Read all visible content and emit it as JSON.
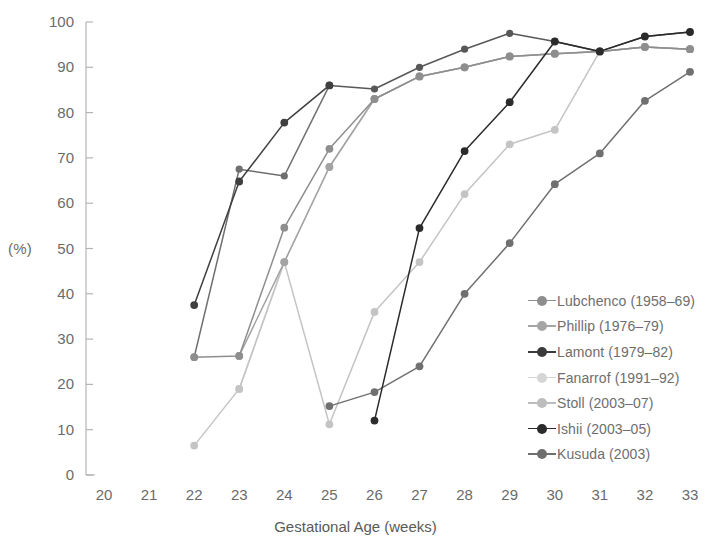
{
  "chart_data": {
    "type": "line",
    "title": "",
    "xlabel": "Gestational Age (weeks)",
    "ylabel": "(%)",
    "xlim": [
      20,
      33
    ],
    "ylim": [
      0,
      100
    ],
    "xticks": [
      20,
      21,
      22,
      23,
      24,
      25,
      26,
      27,
      28,
      29,
      30,
      31,
      32,
      33
    ],
    "yticks": [
      0,
      10,
      20,
      30,
      40,
      50,
      60,
      70,
      80,
      90,
      100
    ],
    "grid": false,
    "legend_position": "right-lower",
    "categories": [
      20,
      21,
      22,
      23,
      24,
      25,
      26,
      27,
      28,
      29,
      30,
      31,
      32,
      33
    ],
    "series": [
      {
        "name": "Lubchenco (1958–69)",
        "color": "#8e8e8e",
        "x": [
          22,
          23,
          24,
          25,
          26,
          27,
          28,
          29,
          30,
          31,
          32,
          33
        ],
        "values": [
          26.0,
          26.3,
          54.6,
          72.0,
          83.0,
          88.0,
          90.0,
          92.4,
          93.0,
          93.5,
          94.5,
          94.0
        ]
      },
      {
        "name": "Phillip (1976–79)",
        "color": "#a3a3a3",
        "x": [
          23,
          24,
          25,
          26,
          27,
          28,
          29,
          30,
          31,
          32,
          33
        ],
        "values": [
          26.3,
          47.0,
          68.0,
          83.0,
          88.0,
          90.0,
          92.4,
          93.0,
          93.5,
          94.5,
          94.0
        ]
      },
      {
        "name": "Lamont (1979–82)",
        "color": "#3f3f3f",
        "x": [
          22,
          23,
          24,
          25
        ],
        "values": [
          37.5,
          64.8,
          77.8,
          86.0
        ]
      },
      {
        "name": "Fanarrof (1991–92)",
        "color": "#d2d2d2",
        "x": [
          23,
          24,
          25,
          26,
          27,
          28,
          29,
          30,
          31,
          32,
          33
        ],
        "values": [
          19.0,
          47.0,
          68.0,
          83.0,
          88.0,
          90.0,
          92.4,
          93.0,
          93.5,
          94.5,
          94.0
        ]
      },
      {
        "name": "Stoll (2003–07)",
        "color": "#c4c4c4",
        "x": [
          22,
          23,
          24,
          25,
          26,
          27,
          28,
          29,
          30,
          31,
          32,
          33
        ],
        "values": [
          6.5,
          19.0,
          47.0,
          11.2,
          36.0,
          47.0,
          62.0,
          73.0,
          76.2,
          93.5,
          94.5,
          94.0
        ]
      },
      {
        "name": "Ishii (2003–05)",
        "color": "#2b2b2b",
        "x": [
          26,
          27,
          28,
          29,
          30,
          31,
          32,
          33
        ],
        "values": [
          12.0,
          54.5,
          71.5,
          82.3,
          95.7,
          93.5,
          96.8,
          97.8
        ]
      },
      {
        "name": "Kusuda (2003)",
        "color": "#707070",
        "x": [
          25,
          26,
          27,
          28,
          29,
          30,
          31,
          32,
          33
        ],
        "values": [
          15.2,
          18.3,
          24.0,
          40.0,
          51.2,
          64.2,
          71.0,
          82.6,
          89.0
        ]
      }
    ],
    "extra_lines": [
      {
        "name": "upper-plateau-dark",
        "color": "#585858",
        "x": [
          25,
          26,
          27,
          28,
          29,
          30,
          31,
          32,
          33
        ],
        "values": [
          86.0,
          85.2,
          90.0,
          94.0,
          97.5,
          95.7,
          93.5,
          96.8,
          97.8
        ]
      },
      {
        "name": "lamont-plateau",
        "color": "#6e6e6e",
        "x": [
          22,
          23,
          24,
          25
        ],
        "values": [
          26.0,
          67.5,
          66.0,
          86.0
        ]
      }
    ]
  },
  "legend": {
    "items": [
      {
        "label": "Lubchenco (1958–69)",
        "color": "#8e8e8e"
      },
      {
        "label": "Phillip (1976–79)",
        "color": "#a5a5a5"
      },
      {
        "label": "Lamont (1979–82)",
        "color": "#3a3a3a"
      },
      {
        "label": "Fanarrof (1991–92)",
        "color": "#d6d6d6"
      },
      {
        "label": "Stoll (2003–07)",
        "color": "#bdbdbd"
      },
      {
        "label": "Ishii (2003–05)",
        "color": "#2b2b2b"
      },
      {
        "label": "Kusuda (2003)",
        "color": "#6e6e6e"
      }
    ]
  },
  "axes": {
    "y_axis_caption": "(%)",
    "x_axis_title": "Gestational Age (weeks)",
    "y_tick_labels": [
      "100",
      "90",
      "80",
      "70",
      "60",
      "50",
      "40",
      "30",
      "20",
      "10",
      "0"
    ],
    "x_tick_labels": [
      "20",
      "21",
      "22",
      "23",
      "24",
      "25",
      "26",
      "27",
      "28",
      "29",
      "30",
      "31",
      "32",
      "33"
    ]
  }
}
